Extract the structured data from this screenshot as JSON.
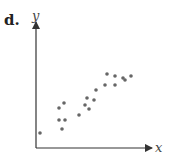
{
  "panel_label": "d.",
  "chart_data": {
    "type": "scatter",
    "title": "",
    "xlabel": "x",
    "ylabel": "y",
    "xlim": [
      0,
      120
    ],
    "ylim": [
      0,
      130
    ],
    "grid": false,
    "ticks": false,
    "point_color": "#666666",
    "axis_color": "#333333",
    "points": [
      {
        "x": 4,
        "y": 15
      },
      {
        "x": 23,
        "y": 40
      },
      {
        "x": 28,
        "y": 45
      },
      {
        "x": 23,
        "y": 28
      },
      {
        "x": 29,
        "y": 28
      },
      {
        "x": 26,
        "y": 19
      },
      {
        "x": 43,
        "y": 33
      },
      {
        "x": 49,
        "y": 43
      },
      {
        "x": 51,
        "y": 50
      },
      {
        "x": 53,
        "y": 39
      },
      {
        "x": 58,
        "y": 48
      },
      {
        "x": 60,
        "y": 58
      },
      {
        "x": 69,
        "y": 63
      },
      {
        "x": 71,
        "y": 74
      },
      {
        "x": 79,
        "y": 72
      },
      {
        "x": 79,
        "y": 63
      },
      {
        "x": 87,
        "y": 70
      },
      {
        "x": 89,
        "y": 68
      },
      {
        "x": 95,
        "y": 72
      }
    ]
  }
}
